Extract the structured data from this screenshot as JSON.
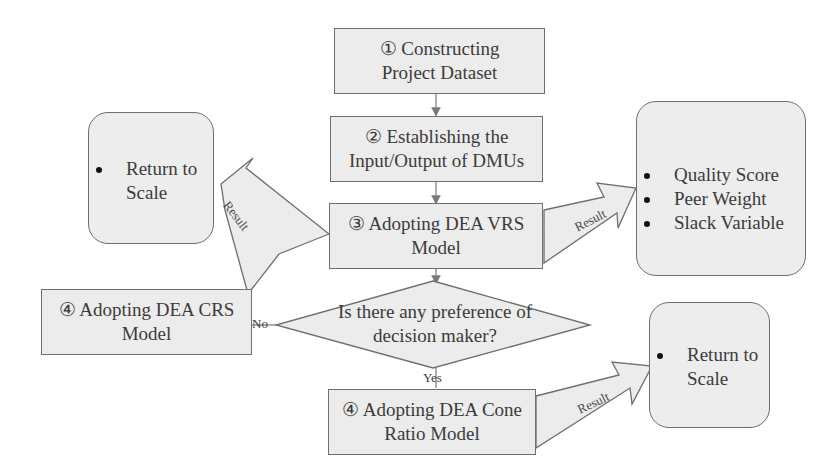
{
  "diagram": {
    "steps": {
      "step1": {
        "line1": "① Constructing",
        "line2": "Project Dataset"
      },
      "step2": {
        "line1": "② Establishing the",
        "line2": "Input/Output of DMUs"
      },
      "step3": {
        "line1": "③ Adopting DEA VRS",
        "line2": "Model"
      },
      "step4_crs": {
        "line1": "④ Adopting DEA CRS",
        "line2": "Model"
      },
      "step4_cone": {
        "line1": "④ Adopting DEA Cone",
        "line2": "Ratio Model"
      }
    },
    "decision": {
      "line1": "Is there any preference of",
      "line2": "decision maker?",
      "no_label": "No",
      "yes_label": "Yes"
    },
    "results": {
      "left": {
        "items": [
          "Return to",
          "Scale"
        ]
      },
      "right": {
        "items": [
          "Quality Score",
          "Peer Weight",
          "Slack Variable"
        ]
      },
      "bottom": {
        "items": [
          "Return to",
          "Scale"
        ]
      }
    },
    "arrow_label": "Result"
  }
}
